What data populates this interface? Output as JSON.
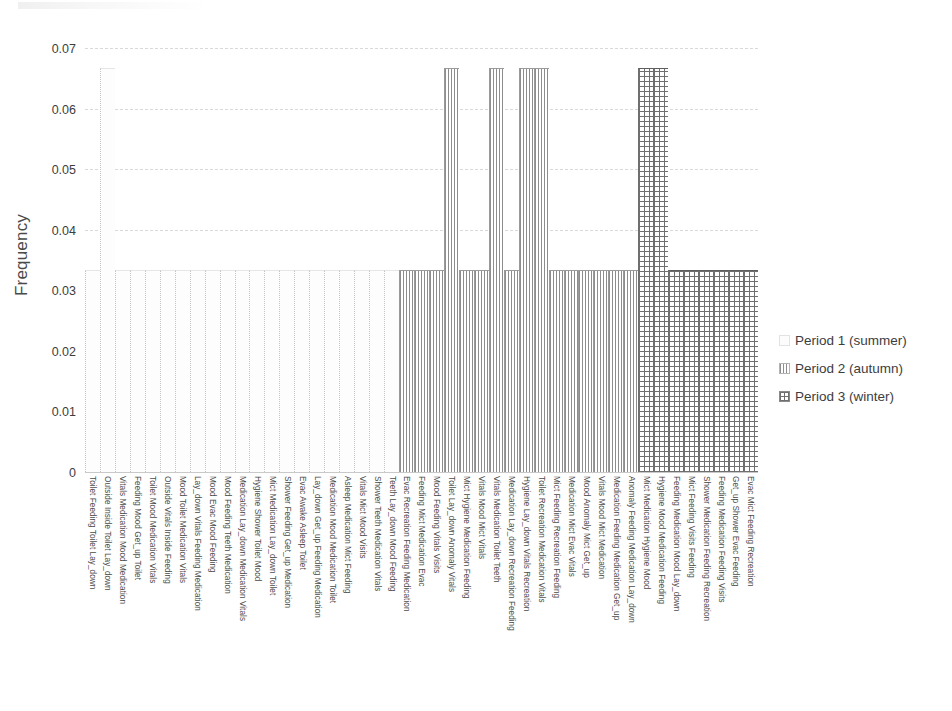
{
  "chart_data": {
    "type": "bar",
    "title": "",
    "subtitle": "",
    "xlabel": "",
    "ylabel": "Frequency",
    "ylim": [
      0,
      0.07
    ],
    "yticks": [
      "0",
      "0.01",
      "0.02",
      "0.03",
      "0.04",
      "0.05",
      "0.06",
      "0.07"
    ],
    "ytick_values": [
      0,
      0.01,
      0.02,
      0.03,
      0.04,
      0.05,
      0.06,
      0.07
    ],
    "grid": true,
    "legend_position": "right",
    "bar_value_common": 0.0333,
    "bar_value_tall": 0.0667,
    "series": [
      {
        "name": "Period 1 (summer)",
        "pattern": "dotted",
        "color": "#cfcfcf",
        "categories": [
          "Toilet Feeding Toilet Lay_down",
          "Outside Inside Toilet Lay_down",
          "Vitals Medication Mood Medication",
          "Feeding Mood Get_up Toilet",
          "Toilet Mood Medication Vitals",
          "Outside Vitals Inside Feeding",
          "Mood Toilet Medication Vitals",
          "Lay_down Vitals Feeding Medication",
          "Mood Evac Mood Feeding",
          "Mood Feeding Teeth Medication",
          "Medication Lay_down Medication Vitals",
          "Hygiene Shower Toilet Mood",
          "Mict Medication Lay_down Toilet",
          "Shower Feeding Get_up Medication",
          "Evac Awake Asleep Toilet",
          "Lay_down Get_up Feeding Medication",
          "Medication Mood Medication Toilet",
          "Asleep Medication Mict Feeding",
          "Vitals Mict Mood Visits",
          "Shower Teeth Medication Vitals",
          "Teeth Lay_down Mood Feeding"
        ],
        "values": [
          0.0333,
          0.0667,
          0.0333,
          0.0333,
          0.0333,
          0.0333,
          0.0333,
          0.0333,
          0.0333,
          0.0333,
          0.0333,
          0.0333,
          0.0333,
          0.0333,
          0.0333,
          0.0333,
          0.0333,
          0.0333,
          0.0333,
          0.0333,
          0.0333
        ]
      },
      {
        "name": "Period 2 (autumn)",
        "pattern": "vertical-lines",
        "color": "#8d8d8d",
        "categories": [
          "Evac Recreation Feeding Medication",
          "Feeding Mict Medication Evac",
          "Mood Feeding Vitals Visits",
          "Toilet Lay_down Anomaly Vitals",
          "Mict Hygiene Medication Feeding",
          "Vitals Mood Mict Vitals",
          "Vitals Medication Toilet Teeth",
          "Medication Lay_down Recreation Feeding",
          "Hygiene Lay_down Vitals Recreation",
          "Toilet Recreation Medication Vitals",
          "Mict Feeding Recreation Feeding",
          "Medication Mict Evac Vitals",
          "Mood Anomaly Mict Get_up",
          "Vitals Mood Mict Medication",
          "Medication Feeding Medication Get_up",
          "Anomaly Feeding Medication Lay_down"
        ],
        "values": [
          0.0333,
          0.0333,
          0.0333,
          0.0667,
          0.0333,
          0.0333,
          0.0667,
          0.0333,
          0.0667,
          0.0667,
          0.0333,
          0.0333,
          0.0333,
          0.0333,
          0.0333,
          0.0333
        ]
      },
      {
        "name": "Period 3 (winter)",
        "pattern": "crosshatch",
        "color": "#6f6f6f",
        "categories": [
          "Mict Medication Hygiene Mood",
          "Hygiene Mood Medication Feeding",
          "Feeding Medication Mood Lay_down",
          "Mict Feeding Visits Feeding",
          "Shower Medication Feeding Recreation",
          "Feeding Medication Feeding Visits",
          "Get_up Shower Evac Feeding",
          "Evac Mict Feeding Recreation"
        ],
        "values": [
          0.0667,
          0.0667,
          0.0333,
          0.0333,
          0.0333,
          0.0333,
          0.0333,
          0.0333
        ]
      }
    ]
  },
  "axis": {
    "ylabel": "Frequency",
    "yticks": [
      "0.07",
      "0.06",
      "0.05",
      "0.04",
      "0.03",
      "0.02",
      "0.01",
      "0"
    ]
  },
  "legend": {
    "entries": [
      {
        "label": "Period 1 (summer)",
        "swatch": "dotted-swatch"
      },
      {
        "label": "Period 2 (autumn)",
        "swatch": "vertical-lines-swatch"
      },
      {
        "label": "Period 3 (winter)",
        "swatch": "crosshatch-swatch"
      }
    ]
  },
  "xaxis": {
    "labels": [
      "Toilet Feeding Toilet Lay_down",
      "Outside Inside Toilet Lay_down",
      "Vitals Medication Mood Medication",
      "Feeding Mood Get_up Toilet",
      "Toilet Mood Medication Vitals",
      "Outside Vitals Inside Feeding",
      "Mood Toilet Medication Vitals",
      "Lay_down Vitals Feeding Medication",
      "Mood Evac Mood Feeding",
      "Mood Feeding Teeth Medication",
      "Medication Lay_down Medication Vitals",
      "Hygiene Shower Toilet Mood",
      "Mict Medication Lay_down Toilet",
      "Shower Feeding Get_up Medication",
      "Evac Awake Asleep Toilet",
      "Lay_down Get_up Feeding Medication",
      "Medication Mood Medication Toilet",
      "Asleep Medication Mict Feeding",
      "Vitals Mict Mood Visits",
      "Shower Teeth Medication Vitals",
      "Teeth Lay_down Mood Feeding",
      "Evac Recreation Feeding Medication",
      "Feeding Mict Medication Evac",
      "Mood Feeding Vitals Visits",
      "Toilet Lay_down Anomaly Vitals",
      "Mict Hygiene Medication Feeding",
      "Vitals Mood Mict Vitals",
      "Vitals Medication Toilet Teeth",
      "Medication Lay_down Recreation Feeding",
      "Hygiene Lay_down Vitals Recreation",
      "Toilet Recreation Medication Vitals",
      "Mict Feeding Recreation Feeding",
      "Medication Mict Evac Vitals",
      "Mood Anomaly Mict Get_up",
      "Vitals Mood Mict Medication",
      "Medication Feeding Medication Get_up",
      "Anomaly Feeding Medication Lay_down",
      "Mict Medication Hygiene Mood",
      "Hygiene Mood Medication Feeding",
      "Feeding Medication Mood Lay_down",
      "Mict Feeding Visits Feeding",
      "Shower Medication Feeding Recreation",
      "Feeding Medication Feeding Visits",
      "Get_up Shower Evac Feeding",
      "Evac Mict Feeding Recreation"
    ]
  }
}
